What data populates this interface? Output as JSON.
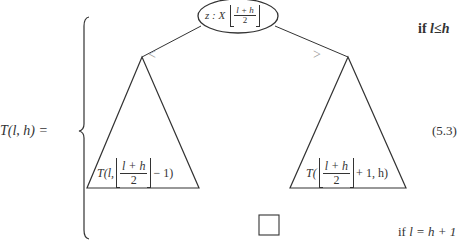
{
  "equation": {
    "lhs": "T(l, h) =",
    "number": "(5.3)"
  },
  "cases": [
    {
      "condition_prefix": "if ",
      "condition_math": "l≤h"
    },
    {
      "condition_prefix": "if ",
      "condition_math": "l = h + 1"
    }
  ],
  "tree": {
    "root": {
      "prefix": "z : X",
      "floor_numerator": "l + h",
      "floor_denominator": "2"
    },
    "edges": {
      "left_label": "<",
      "right_label": ">"
    },
    "left_subtree": {
      "prefix": "T(l,",
      "floor_numerator": "l + h",
      "floor_denominator": "2",
      "suffix": "− 1)"
    },
    "right_subtree": {
      "prefix": "T(",
      "floor_numerator": "l + h",
      "floor_denominator": "2",
      "suffix": "+ 1, h)"
    },
    "empty_tree_symbol": "□"
  }
}
